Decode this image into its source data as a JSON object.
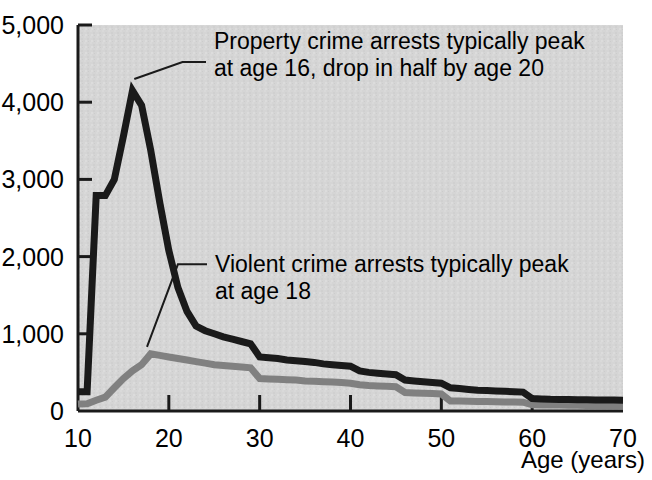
{
  "chart_data": {
    "type": "line",
    "title": "",
    "xlabel": "Age (years)",
    "ylabel": "",
    "xlim": [
      10,
      70
    ],
    "ylim": [
      0,
      5000
    ],
    "grid": false,
    "legend_position": "none",
    "plot_background": "#d5d5d5",
    "x_ticks": [
      "10",
      "20",
      "30",
      "40",
      "50",
      "60",
      "70"
    ],
    "x_tick_values": [
      10,
      20,
      30,
      40,
      50,
      60,
      70
    ],
    "y_ticks": [
      "0",
      "1,000",
      "2,000",
      "3,000",
      "4,000",
      "5,000"
    ],
    "y_tick_values": [
      0,
      1000,
      2000,
      3000,
      4000,
      5000
    ],
    "x": [
      10,
      11,
      12,
      13,
      14,
      15,
      16,
      17,
      18,
      19,
      20,
      21,
      22,
      23,
      24,
      25,
      26,
      27,
      28,
      29,
      30,
      31,
      32,
      33,
      34,
      35,
      36,
      37,
      38,
      39,
      40,
      41,
      42,
      43,
      44,
      45,
      46,
      47,
      48,
      49,
      50,
      51,
      52,
      53,
      54,
      55,
      56,
      57,
      58,
      59,
      60,
      61,
      62,
      63,
      64,
      65,
      66,
      67,
      68,
      69,
      70
    ],
    "series": [
      {
        "name": "Property crime arrests",
        "color": "#1a1a1a",
        "width": 7,
        "values": [
          250,
          250,
          2790,
          2790,
          3000,
          3560,
          4150,
          3960,
          3380,
          2700,
          2080,
          1600,
          1290,
          1100,
          1040,
          1000,
          960,
          930,
          900,
          870,
          700,
          690,
          680,
          660,
          650,
          640,
          630,
          610,
          600,
          590,
          580,
          520,
          500,
          490,
          480,
          470,
          400,
          390,
          380,
          370,
          360,
          300,
          290,
          280,
          270,
          265,
          260,
          255,
          250,
          245,
          160,
          155,
          152,
          150,
          148,
          146,
          145,
          143,
          142,
          141,
          140
        ]
      },
      {
        "name": "Violent crime arrests",
        "color": "#808080",
        "width": 7,
        "values": [
          90,
          95,
          140,
          180,
          300,
          420,
          520,
          600,
          740,
          720,
          700,
          680,
          660,
          640,
          620,
          600,
          590,
          580,
          570,
          560,
          420,
          415,
          410,
          405,
          400,
          390,
          385,
          380,
          375,
          370,
          360,
          340,
          330,
          325,
          320,
          315,
          240,
          235,
          230,
          225,
          220,
          130,
          128,
          126,
          124,
          122,
          120,
          118,
          116,
          114,
          80,
          78,
          77,
          76,
          75,
          74,
          73,
          72,
          71,
          70,
          70
        ]
      }
    ],
    "annotations": [
      {
        "id": "property-annotation",
        "lines": [
          "Property crime arrests typically peak",
          "at age 16, drop in half by age 20"
        ],
        "leader_from": {
          "age": 16.2,
          "value": 4300
        },
        "leader_to": {
          "age": 21.5,
          "value": 4520
        }
      },
      {
        "id": "violent-annotation",
        "lines": [
          "Violent crime arrests typically peak",
          "at age 18"
        ],
        "leader_from": {
          "age": 17.6,
          "value": 830
        },
        "leader_to": {
          "age": 21.0,
          "value": 1900
        }
      }
    ]
  }
}
